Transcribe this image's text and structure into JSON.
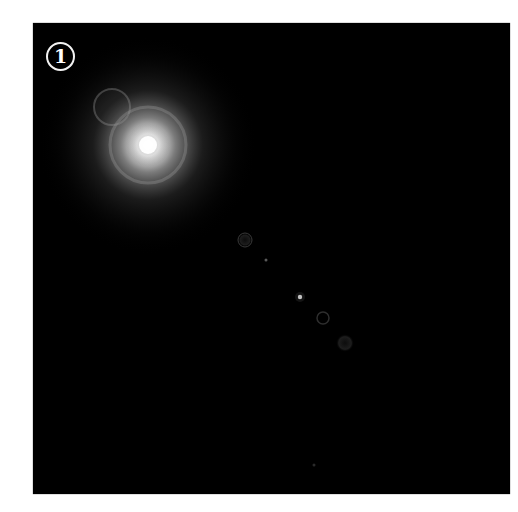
{
  "badge": {
    "label": "1"
  },
  "scene": {
    "background": "#000000",
    "frame_border": "#444444",
    "sun": {
      "x": 115,
      "y": 122,
      "core_color": "#ffffff"
    },
    "artifacts": [
      {
        "type": "ring",
        "x": 79,
        "y": 84,
        "r": 18
      },
      {
        "type": "ring",
        "x": 115,
        "y": 122,
        "r": 38
      },
      {
        "type": "ghost",
        "x": 212,
        "y": 217,
        "r": 7
      },
      {
        "type": "dot",
        "x": 233,
        "y": 237,
        "r": 1.5
      },
      {
        "type": "dot",
        "x": 267,
        "y": 274,
        "r": 2
      },
      {
        "type": "ghost",
        "x": 290,
        "y": 295,
        "r": 6
      },
      {
        "type": "ghost",
        "x": 312,
        "y": 320,
        "r": 9
      },
      {
        "type": "dot",
        "x": 281,
        "y": 442,
        "r": 1.5
      }
    ]
  }
}
